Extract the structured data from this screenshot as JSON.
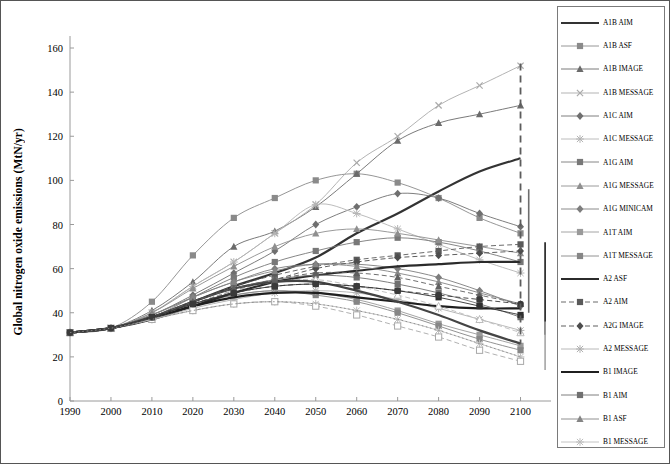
{
  "chart_data": {
    "type": "line",
    "title": "",
    "xlabel": "",
    "ylabel": "Global nitrogen oxide emissions (MtN/yr)",
    "xlim": [
      1990,
      2105
    ],
    "ylim": [
      0,
      160
    ],
    "xticks": [
      "1990",
      "2000",
      "2010",
      "2020",
      "2030",
      "2040",
      "2050",
      "2060",
      "2070",
      "2080",
      "2090",
      "2100"
    ],
    "yticks": [
      "0",
      "20",
      "40",
      "60",
      "80",
      "100",
      "120",
      "140",
      "160"
    ],
    "grid": false,
    "legend_position": "right",
    "x": [
      1990,
      2000,
      2010,
      2020,
      2030,
      2040,
      2050,
      2060,
      2070,
      2080,
      2090,
      2100
    ],
    "series": [
      {
        "name": "A1B AIM",
        "style": "solid-thick",
        "marker": "none",
        "color": "#333333",
        "values": [
          31,
          33,
          38,
          45,
          52,
          58,
          65,
          76,
          85,
          95,
          104,
          110
        ]
      },
      {
        "name": "A1B ASF",
        "style": "solid",
        "marker": "square",
        "color": "#8a8a8a",
        "values": [
          31,
          33,
          45,
          66,
          83,
          92,
          100,
          103,
          99,
          92,
          83,
          76
        ]
      },
      {
        "name": "A1B IMAGE",
        "style": "solid",
        "marker": "triangle",
        "color": "#6b6b6b",
        "values": [
          31,
          33,
          41,
          54,
          70,
          77,
          88,
          103,
          118,
          126,
          130,
          134
        ]
      },
      {
        "name": "A1B MESSAGE",
        "style": "solid",
        "marker": "x",
        "color": "#aaaaaa",
        "values": [
          31,
          33,
          40,
          52,
          63,
          76,
          89,
          108,
          120,
          134,
          143,
          152
        ]
      },
      {
        "name": "A1C AIM",
        "style": "solid",
        "marker": "diamond",
        "color": "#6f6f6f",
        "values": [
          31,
          33,
          39,
          48,
          58,
          68,
          80,
          88,
          94,
          92,
          85,
          79
        ]
      },
      {
        "name": "A1C MESSAGE",
        "style": "solid",
        "marker": "star",
        "color": "#b4b4b4",
        "values": [
          31,
          33,
          40,
          52,
          63,
          76,
          89,
          85,
          78,
          71,
          64,
          58
        ]
      },
      {
        "name": "A1G AIM",
        "style": "solid",
        "marker": "square",
        "color": "#787878",
        "values": [
          31,
          33,
          38,
          47,
          56,
          63,
          68,
          72,
          74,
          72,
          68,
          63
        ]
      },
      {
        "name": "A1G MESSAGE",
        "style": "solid",
        "marker": "triangle",
        "color": "#8f8f8f",
        "values": [
          31,
          33,
          40,
          51,
          61,
          70,
          76,
          78,
          76,
          73,
          70,
          67
        ]
      },
      {
        "name": "A1G MINICAM",
        "style": "solid",
        "marker": "diamond",
        "color": "#7d7d7d",
        "values": [
          31,
          33,
          39,
          47,
          54,
          60,
          62,
          62,
          60,
          56,
          50,
          43
        ]
      },
      {
        "name": "A1T AIM",
        "style": "solid",
        "marker": "square",
        "color": "#9a9a9a",
        "values": [
          31,
          33,
          37,
          43,
          48,
          50,
          49,
          46,
          41,
          35,
          30,
          25
        ]
      },
      {
        "name": "A1T MESSAGE",
        "style": "solid",
        "marker": "square",
        "color": "#868686",
        "values": [
          31,
          33,
          38,
          44,
          48,
          50,
          48,
          45,
          40,
          34,
          28,
          23
        ]
      },
      {
        "name": "A2 ASF",
        "style": "solid-thick",
        "marker": "none",
        "color": "#2b2b2b",
        "values": [
          31,
          33,
          37,
          43,
          49,
          54,
          57,
          59,
          61,
          62,
          63,
          63
        ]
      },
      {
        "name": "A2 AIM",
        "style": "dashed",
        "marker": "square",
        "color": "#5a5a5a",
        "values": [
          31,
          33,
          38,
          45,
          52,
          57,
          61,
          64,
          66,
          68,
          70,
          71
        ]
      },
      {
        "name": "A2G IMAGE",
        "style": "dashed",
        "marker": "diamond",
        "color": "#4d4d4d",
        "values": [
          31,
          33,
          38,
          44,
          50,
          55,
          60,
          63,
          65,
          66,
          67,
          68
        ]
      },
      {
        "name": "A2 MESSAGE",
        "style": "solid",
        "marker": "star",
        "color": "#b0b0b0",
        "values": [
          31,
          33,
          37,
          42,
          46,
          49,
          50,
          49,
          46,
          42,
          37,
          32
        ]
      },
      {
        "name": "B1 IMAGE",
        "style": "solid-thick",
        "marker": "none",
        "color": "#1f1f1f",
        "values": [
          31,
          33,
          38,
          43,
          47,
          49,
          49,
          47,
          45,
          43,
          42,
          42
        ]
      },
      {
        "name": "B1 AIM",
        "style": "solid",
        "marker": "square",
        "color": "#707070",
        "values": [
          31,
          33,
          38,
          45,
          51,
          55,
          57,
          56,
          53,
          49,
          44,
          38
        ]
      },
      {
        "name": "B1 ASF",
        "style": "solid",
        "marker": "triangle",
        "color": "#858585",
        "values": [
          31,
          33,
          39,
          47,
          54,
          59,
          62,
          61,
          58,
          54,
          49,
          44
        ]
      },
      {
        "name": "B1 MESSAGE",
        "style": "solid",
        "marker": "star",
        "color": "#bdbdbd",
        "values": [
          31,
          33,
          37,
          41,
          44,
          45,
          44,
          41,
          37,
          32,
          26,
          20
        ]
      },
      {
        "name": "B1T MESSAGE",
        "style": "dashed",
        "marker": "square-open",
        "color": "#a8a8a8",
        "values": [
          31,
          33,
          37,
          41,
          44,
          45,
          43,
          39,
          34,
          29,
          23,
          18
        ]
      },
      {
        "name": "B1HIGH MESSAGE",
        "style": "dashed",
        "marker": "triangle-open",
        "color": "#bcbcbc",
        "values": [
          31,
          33,
          38,
          44,
          50,
          54,
          55,
          52,
          48,
          43,
          37,
          31
        ]
      },
      {
        "name": "B2 MESSAGE",
        "style": "solid-thick",
        "marker": "none",
        "color": "#444444",
        "values": [
          31,
          33,
          38,
          45,
          51,
          54,
          54,
          50,
          45,
          39,
          32,
          26
        ]
      },
      {
        "name": "B2 AIM",
        "style": "solid",
        "marker": "square-filled",
        "color": "#2f2f2f",
        "values": [
          31,
          33,
          38,
          44,
          49,
          52,
          53,
          52,
          50,
          47,
          43,
          39
        ]
      },
      {
        "name": "B2 ASF",
        "style": "dashed",
        "marker": "triangle",
        "color": "#5f5f5f",
        "values": [
          31,
          33,
          38,
          45,
          51,
          55,
          58,
          58,
          56,
          52,
          48,
          44
        ]
      },
      {
        "name": "B2 IMAGE",
        "style": "dashed",
        "marker": "circle",
        "color": "#3a3a3a",
        "values": [
          31,
          33,
          38,
          44,
          49,
          52,
          53,
          52,
          50,
          48,
          46,
          44
        ]
      },
      {
        "name": "5%",
        "style": "dotted",
        "marker": "none",
        "color": "#8b8b8b",
        "values": [
          31,
          33,
          37,
          41,
          44,
          45,
          44,
          41,
          37,
          32,
          26,
          20
        ]
      }
    ],
    "range_bars": [
      {
        "name": "dashed-range-bar",
        "x": 2100,
        "y0": 26,
        "y1": 153,
        "style": "dashed",
        "color": "#5c5c5c"
      },
      {
        "name": "solid-dark-range-bar",
        "x": 2102,
        "y0": 40,
        "y1": 96,
        "style": "solid",
        "color": "#6e6e6e"
      },
      {
        "name": "solid-black-range-bar",
        "x": 2106,
        "y0": 30,
        "y1": 72,
        "style": "solid",
        "color": "#1a1a1a"
      },
      {
        "name": "light-range-bar",
        "x": 2106,
        "y0": 14,
        "y1": 36,
        "style": "solid",
        "color": "#a5a5a5"
      }
    ]
  },
  "legend": {
    "items": [
      {
        "label": "A1B AIM",
        "style": "solid-thick",
        "marker": "none",
        "color": "#333333"
      },
      {
        "label": "A1B ASF",
        "style": "solid",
        "marker": "square",
        "color": "#8a8a8a"
      },
      {
        "label": "A1B IMAGE",
        "style": "solid",
        "marker": "triangle",
        "color": "#6b6b6b"
      },
      {
        "label": "A1B MESSAGE",
        "style": "solid",
        "marker": "x",
        "color": "#aaaaaa"
      },
      {
        "label": "A1C AIM",
        "style": "solid",
        "marker": "diamond",
        "color": "#6f6f6f"
      },
      {
        "label": "A1C MESSAGE",
        "style": "solid",
        "marker": "star",
        "color": "#b4b4b4"
      },
      {
        "label": "A1G AIM",
        "style": "solid",
        "marker": "square",
        "color": "#787878"
      },
      {
        "label": "A1G MESSAGE",
        "style": "solid",
        "marker": "triangle",
        "color": "#8f8f8f"
      },
      {
        "label": "A1G MINICAM",
        "style": "solid",
        "marker": "diamond",
        "color": "#7d7d7d"
      },
      {
        "label": "A1T AIM",
        "style": "solid",
        "marker": "square",
        "color": "#9a9a9a"
      },
      {
        "label": "A1T MESSAGE",
        "style": "solid",
        "marker": "square",
        "color": "#868686"
      },
      {
        "label": "A2 ASF",
        "style": "solid-thick",
        "marker": "none",
        "color": "#2b2b2b"
      },
      {
        "label": "A2 AIM",
        "style": "dashed",
        "marker": "square",
        "color": "#5a5a5a"
      },
      {
        "label": "A2G IMAGE",
        "style": "dashed",
        "marker": "diamond",
        "color": "#4d4d4d"
      },
      {
        "label": "A2 MESSAGE",
        "style": "solid",
        "marker": "star",
        "color": "#b0b0b0"
      },
      {
        "label": "B1 IMAGE",
        "style": "solid-thick",
        "marker": "none",
        "color": "#1f1f1f"
      },
      {
        "label": "B1 AIM",
        "style": "solid",
        "marker": "square",
        "color": "#707070"
      },
      {
        "label": "B1 ASF",
        "style": "solid",
        "marker": "triangle",
        "color": "#858585"
      },
      {
        "label": "B1 MESSAGE",
        "style": "solid",
        "marker": "star",
        "color": "#bdbdbd"
      },
      {
        "label": "B1T MESSAGE",
        "style": "dashed",
        "marker": "square-open",
        "color": "#a8a8a8"
      },
      {
        "label": "B1HIGH\nMESSAGE",
        "style": "dashed",
        "marker": "triangle-open",
        "color": "#bcbcbc"
      },
      {
        "label": "B2 MESSAGE",
        "style": "solid-thick",
        "marker": "none",
        "color": "#444444"
      },
      {
        "label": "B2 AIM",
        "style": "solid",
        "marker": "square-filled",
        "color": "#2f2f2f"
      },
      {
        "label": "B2 ASF",
        "style": "dashed",
        "marker": "triangle",
        "color": "#5f5f5f"
      },
      {
        "label": "B2 IMAGE",
        "style": "dashed",
        "marker": "circle",
        "color": "#3a3a3a"
      },
      {
        "label": "5%",
        "style": "dotted",
        "marker": "none",
        "color": "#8b8b8b"
      }
    ]
  }
}
